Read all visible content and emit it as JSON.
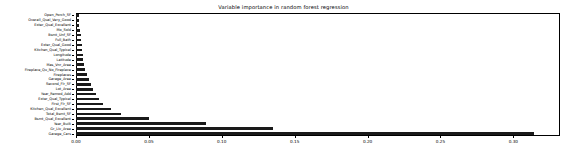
{
  "chart_data": {
    "type": "bar",
    "orientation": "horizontal",
    "title": "Variable importance in random forest regression",
    "xlabel": "",
    "ylabel": "",
    "xlim": [
      0.0,
      0.332
    ],
    "grid": false,
    "legend": null,
    "bar_color": "#1a1a1a",
    "xticks": [
      0.0,
      0.05,
      0.1,
      0.15,
      0.2,
      0.25,
      0.3
    ],
    "xtick_labels": [
      "0.00",
      "0.05",
      "0.10",
      "0.15",
      "0.20",
      "0.25",
      "0.30"
    ],
    "categories": [
      "Open_Porch_SF",
      "Overall_Qual_Very_Good",
      "Exter_Qual_Excellent",
      "Mo_Sold",
      "Bsmt_Unf_SF",
      "Full_Bath",
      "Exter_Qual_Good",
      "Kitchen_Qual_Typical",
      "Longitude",
      "Latitude",
      "Mas_Vnr_Area",
      "Fireplace_Qu_No_Fireplace",
      "Fireplaces",
      "Garage_Area",
      "Second_Flr_SF",
      "Lot_Area",
      "Year_Remod_Add",
      "Exter_Qual_Typical",
      "First_Flr_SF",
      "Kitchen_Qual_Excellent",
      "Total_Bsmt_SF",
      "Bsmt_Qual_Excellent",
      "Year_Built",
      "Gr_Liv_Area",
      "Garage_Cars"
    ],
    "values": [
      0.0018,
      0.0021,
      0.0024,
      0.0026,
      0.0031,
      0.0035,
      0.0039,
      0.0042,
      0.0046,
      0.0051,
      0.0056,
      0.0062,
      0.0075,
      0.0089,
      0.0102,
      0.0119,
      0.0136,
      0.0158,
      0.0185,
      0.0241,
      0.0309,
      0.0501,
      0.0895,
      0.1348,
      0.3142
    ]
  }
}
